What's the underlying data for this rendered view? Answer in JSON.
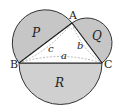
{
  "diagram": {
    "vertices": {
      "A": "A",
      "B": "B",
      "C": "C"
    },
    "regions": {
      "P": "P",
      "Q": "Q",
      "R": "R"
    },
    "sides": {
      "a": "a",
      "b": "b",
      "c": "c"
    },
    "colors": {
      "fill": "#c8c8c8",
      "stroke": "#333333",
      "dashed": "#9a9a9a"
    }
  }
}
